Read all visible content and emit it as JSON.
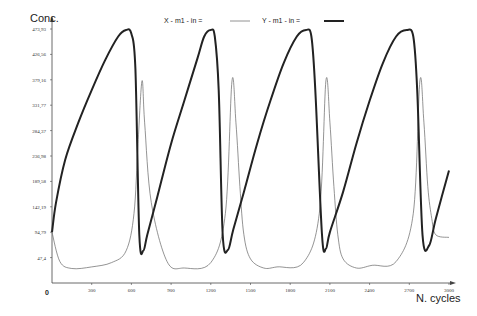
{
  "chart_data": {
    "type": "line",
    "title": "",
    "xlabel": "N. cycles",
    "ylabel": "Conc.",
    "xlim": [
      0,
      3000
    ],
    "ylim": [
      0,
      473.93
    ],
    "grid": false,
    "legend_position": "top",
    "x_ticks": [
      "300",
      "600",
      "900",
      "1200",
      "1500",
      "1800",
      "2100",
      "2400",
      "2700",
      "3000"
    ],
    "x_origin_label": "0",
    "y_ticks": [
      "473,93",
      "426,56",
      "379,16",
      "331,77",
      "284,37",
      "236,98",
      "189,58",
      "142,19",
      "94,79",
      "47,4"
    ],
    "legend": [
      {
        "name": "X - m1 - in =",
        "style": "thin"
      },
      {
        "name": "Y - m1 - in =",
        "style": "thick"
      }
    ],
    "series": [
      {
        "name": "X - m1 - in =",
        "color": "#555555",
        "x": [
          0,
          60,
          150,
          300,
          450,
          560,
          620,
          650,
          680,
          700,
          750,
          870,
          1000,
          1200,
          1310,
          1360,
          1390,
          1420,
          1450,
          1500,
          1600,
          1700,
          1900,
          2020,
          2070,
          2100,
          2130,
          2160,
          2200,
          2300,
          2420,
          2600,
          2730,
          2780,
          2810,
          2840,
          2870,
          2900,
          3000
        ],
        "values": [
          94.8,
          40,
          27,
          30,
          38,
          60,
          130,
          260,
          377,
          300,
          150,
          40,
          28,
          38,
          130,
          377,
          300,
          180,
          90,
          45,
          28,
          30,
          38,
          130,
          377,
          300,
          180,
          90,
          45,
          28,
          33,
          40,
          130,
          377,
          300,
          180,
          120,
          90,
          85
        ]
      },
      {
        "name": "Y - m1 - in =",
        "color": "#222222",
        "x": [
          0,
          30,
          100,
          200,
          300,
          400,
          500,
          560,
          600,
          630,
          660,
          690,
          720,
          800,
          900,
          1000,
          1100,
          1150,
          1200,
          1230,
          1260,
          1290,
          1330,
          1370,
          1450,
          1550,
          1650,
          1750,
          1850,
          1920,
          1960,
          1990,
          2040,
          2070,
          2100,
          2200,
          2300,
          2400,
          2500,
          2600,
          2680,
          2730,
          2760,
          2800,
          2850,
          2900,
          3000
        ],
        "values": [
          94.8,
          150,
          230,
          300,
          360,
          415,
          460,
          472,
          465,
          400,
          90,
          60,
          90,
          165,
          260,
          340,
          420,
          460,
          472,
          460,
          360,
          90,
          62,
          100,
          170,
          260,
          340,
          410,
          460,
          472,
          460,
          360,
          90,
          64,
          95,
          170,
          260,
          340,
          410,
          460,
          472,
          460,
          360,
          90,
          70,
          120,
          210
        ]
      }
    ]
  }
}
